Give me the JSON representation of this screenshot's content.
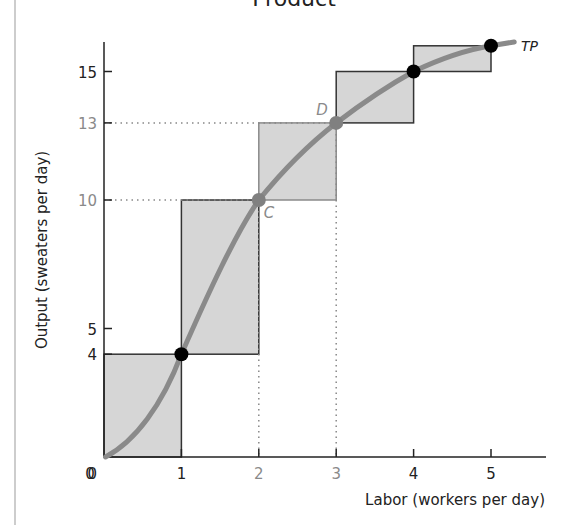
{
  "chart_data": {
    "type": "line",
    "title": "Product",
    "xlabel": "Labor (workers per day)",
    "ylabel": "Output (sweaters per day)",
    "x": [
      0,
      1,
      2,
      3,
      4,
      5
    ],
    "series": [
      {
        "name": "TP",
        "values": [
          0,
          4,
          10,
          13,
          15,
          16
        ]
      }
    ],
    "marginal_product_boxes": [
      {
        "x0": 0,
        "x1": 1,
        "y0": 0,
        "y1": 4
      },
      {
        "x0": 1,
        "x1": 2,
        "y0": 4,
        "y1": 10
      },
      {
        "x0": 2,
        "x1": 3,
        "y0": 10,
        "y1": 13
      },
      {
        "x0": 3,
        "x1": 4,
        "y0": 13,
        "y1": 15
      },
      {
        "x0": 4,
        "x1": 5,
        "y0": 15,
        "y1": 16
      }
    ],
    "x_ticks": [
      "0",
      "1",
      "2",
      "3",
      "4",
      "5"
    ],
    "y_ticks": [
      "0",
      "4",
      "5",
      "10",
      "13",
      "15"
    ],
    "annotations": [
      {
        "label": "C",
        "x": 2,
        "y": 10
      },
      {
        "label": "D",
        "x": 3,
        "y": 13
      },
      {
        "label": "TP",
        "x": 5.3,
        "y": 16
      }
    ],
    "xlim": [
      0,
      5.7
    ],
    "ylim": [
      0,
      16.3
    ],
    "grid": false
  },
  "colors": {
    "curve": "#8a8a8a",
    "box_fill": "#d6d6d6",
    "point_dark": "#000000",
    "point_grey": "#808080",
    "highlight_label": "#8a8a8a"
  }
}
